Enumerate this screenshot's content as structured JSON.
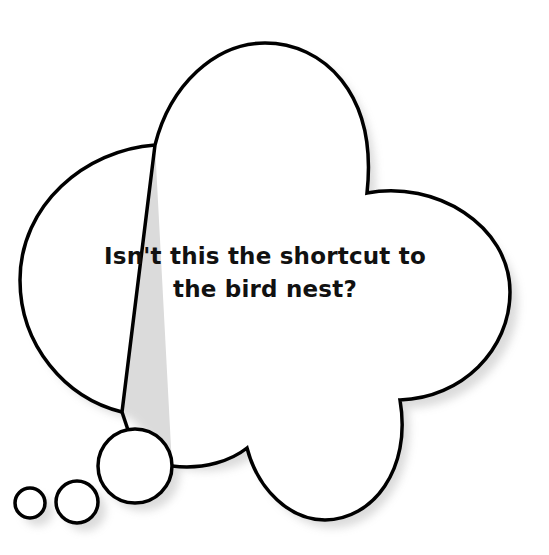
{
  "bubble": {
    "type": "thought-bubble",
    "text_line1": "Isn't this the shortcut to",
    "text_line2": "the bird nest?",
    "stroke_color": "#000000",
    "fill_color": "#ffffff",
    "shadow_color": "#e6e6e6"
  }
}
